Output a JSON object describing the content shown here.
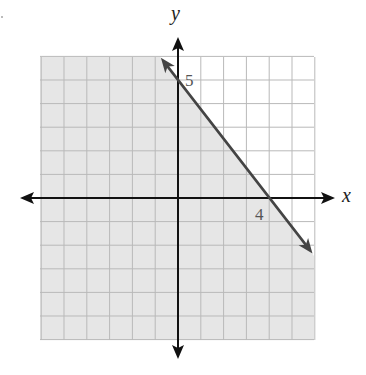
{
  "chart_data": {
    "type": "line",
    "title": "",
    "xlabel": "x",
    "ylabel": "y",
    "xlim": [
      -6,
      6
    ],
    "ylim": [
      -6,
      6
    ],
    "grid": true,
    "series": [
      {
        "name": "boundary line",
        "style": "solid",
        "points": [
          [
            -0.75,
            5.94
          ],
          [
            0,
            5
          ],
          [
            4,
            0
          ],
          [
            5.9,
            -2.35
          ]
        ],
        "slope": -1.25,
        "y_intercept": 5,
        "x_intercept": 4
      }
    ],
    "shaded_region": "below the line (y <= -5/4 x + 5)",
    "annotations": [
      {
        "text": "5",
        "at": [
          0,
          5
        ],
        "meaning": "y-intercept"
      },
      {
        "text": "4",
        "at": [
          4,
          0
        ],
        "meaning": "x-intercept"
      }
    ]
  },
  "labels": {
    "x_axis": "x",
    "y_axis": "y",
    "y_intercept": "5",
    "x_intercept": "4"
  },
  "colors": {
    "shade": "#e6e6e6",
    "grid_shaded": "#b9b9b9",
    "grid_unshaded": "#cfcfcf",
    "axis": "#111111",
    "boundary_line": "#444444",
    "background": "#ffffff"
  },
  "geometry": {
    "origin_px": [
      178,
      198
    ],
    "unit_x_px": 22.8,
    "unit_y_px": 23.6,
    "grid_left_px": 40,
    "grid_top_px": 57,
    "grid_right_px": 314,
    "grid_bottom_px": 340
  }
}
